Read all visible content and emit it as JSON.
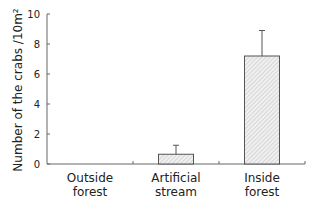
{
  "chart_data": {
    "type": "bar",
    "title": "",
    "xlabel": "",
    "ylabel": "Number of the crabs /10m²",
    "ylim": [
      0,
      10
    ],
    "yticks": [
      0,
      2,
      4,
      6,
      8,
      10
    ],
    "categories": [
      [
        "Outside",
        "forest"
      ],
      [
        "Artificial",
        "stream"
      ],
      [
        "Inside",
        "forest"
      ]
    ],
    "values": [
      0,
      0.65,
      7.2
    ],
    "error_upper": [
      0,
      1.25,
      8.9
    ],
    "grid": false,
    "legend": "none",
    "bar_fill": "hatched light gray",
    "colors": {
      "bar_fill": "#e6e6e6",
      "bar_stroke": "#555555",
      "axis": "#666666"
    }
  }
}
